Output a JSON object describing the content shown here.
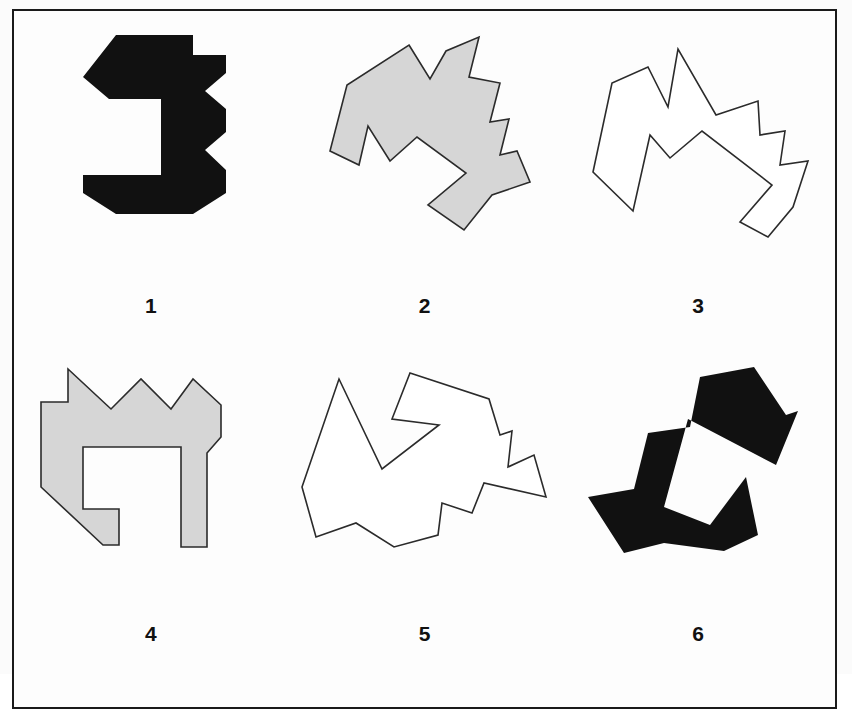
{
  "plate": {
    "border_color": "#1a1a1a",
    "background_color": "#fdfdfd"
  },
  "style": {
    "fill_black": "#111111",
    "fill_gray": "#d6d6d6",
    "fill_white": "#ffffff",
    "stroke_color": "#2b2b2b",
    "stroke_width": "1.6"
  },
  "figures": [
    {
      "label": "1",
      "name": "figure-1",
      "fill": "black",
      "outline": "none",
      "description": "solid black pinwheel hexomino with square white hole",
      "points": "95,10 172,10 172,30 205,30 205,48 184,66 205,84 205,107 184,125 205,145 205,168 172,189 95,189 62,168 62,150 140,150 140,74 88,74 62,52"
    },
    {
      "label": "2",
      "name": "figure-2",
      "fill": "gray",
      "outline": "stroke",
      "description": "gray pinwheel shape rotated, white interior hole",
      "points": "115,20 136,54 152,26 185,12 175,52 206,58 196,97 215,94 206,130 223,126 236,157 198,170 170,205 134,180 172,148 123,112 96,136 74,101 65,140 36,126 53,60"
    },
    {
      "label": "3",
      "name": "figure-3",
      "fill": "white",
      "outline": "stroke",
      "description": "white outlined pinwheel shape, rotated",
      "points": "80,42 100,82 110,24 148,90 190,76 192,110 217,106 212,140 240,136 225,182 200,212 172,197 204,160 134,106 102,133 82,110 65,186 25,147 44,58"
    },
    {
      "label": "4",
      "name": "figure-4",
      "fill": "gray",
      "outline": "stroke",
      "description": "gray pinwheel upright with rectangular white notch",
      "points": "47,12 47,45 20,45 20,130 82,188 98,188 98,152 62,152 62,90 160,90 160,190 186,190 186,96 200,80 200,48 172,22 150,52 120,22 90,52"
    },
    {
      "label": "5",
      "name": "figure-5",
      "fill": "white",
      "outline": "stroke",
      "description": "white outlined pinwheel shape, rotated variant",
      "points": "116,16 195,42 206,78 218,74 214,110 240,98 252,140 190,126 178,156 148,146 144,178 100,190 62,166 22,180 8,130 45,22 88,112 145,68 98,62"
    },
    {
      "label": "6",
      "name": "figure-6",
      "fill": "black",
      "outline": "none",
      "description": "solid black pinwheel shape, rotated, white interior hole",
      "points": "132,20 186,10 218,58 230,54 208,108 120,62 96,150 142,168 178,120 190,178 156,194 96,186 56,196 20,140 66,132 80,76 122,70"
    }
  ]
}
